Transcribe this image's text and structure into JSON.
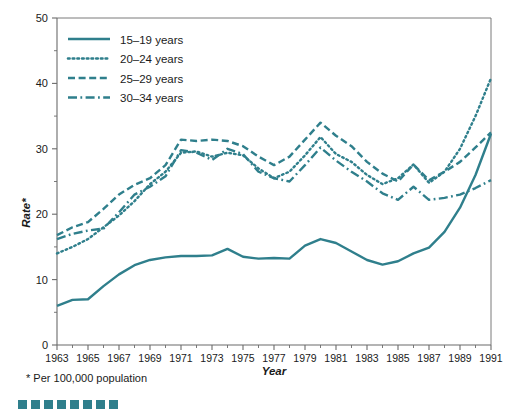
{
  "figure": {
    "footnote": "* Per 100,000 population",
    "accent_color": "#2f7f8c",
    "axis_color": "#6b6b6b",
    "text_color": "#1a1a1a",
    "decor_square_count": 8
  },
  "chart_data": {
    "type": "line",
    "title": "",
    "xlabel": "Year",
    "ylabel": "Rate*",
    "xlim": [
      1963,
      1991
    ],
    "ylim": [
      0,
      50
    ],
    "yticks": [
      0,
      10,
      20,
      30,
      40,
      50
    ],
    "xticks": [
      1963,
      1965,
      1967,
      1969,
      1971,
      1973,
      1975,
      1977,
      1979,
      1981,
      1983,
      1985,
      1987,
      1989,
      1991
    ],
    "xtick_labels": [
      "1963",
      "1965",
      "1967",
      "1969",
      "1971",
      "1973",
      "1975",
      "1977",
      "1979",
      "1981",
      "1983",
      "1985",
      "1987",
      "1989",
      "1991"
    ],
    "ytick_labels": [
      "0",
      "10",
      "20",
      "30",
      "40",
      "50"
    ],
    "grid": false,
    "legend_position": "upper-left-inside",
    "x": [
      1963,
      1964,
      1965,
      1966,
      1967,
      1968,
      1969,
      1970,
      1971,
      1972,
      1973,
      1974,
      1975,
      1976,
      1977,
      1978,
      1979,
      1980,
      1981,
      1982,
      1983,
      1984,
      1985,
      1986,
      1987,
      1988,
      1989,
      1990,
      1991
    ],
    "series": [
      {
        "name": "15–19 years",
        "label": "15–19 years",
        "dash": "solid",
        "color": "#2f7f8c",
        "values": [
          6.0,
          6.9,
          7.0,
          9.0,
          10.8,
          12.2,
          13.0,
          13.4,
          13.6,
          13.6,
          13.7,
          14.7,
          13.5,
          13.2,
          13.3,
          13.2,
          15.2,
          16.2,
          15.6,
          14.3,
          13.0,
          12.3,
          12.8,
          14.0,
          14.9,
          17.3,
          21.0,
          26.0,
          32.3
        ]
      },
      {
        "name": "20–24 years",
        "label": "20–24 years",
        "dash": "dotted",
        "color": "#2f7f8c",
        "values": [
          14.0,
          15.0,
          16.2,
          18.0,
          19.8,
          22.0,
          24.6,
          26.5,
          29.4,
          29.6,
          28.8,
          29.4,
          29.0,
          27.0,
          25.5,
          26.5,
          29.0,
          31.8,
          29.2,
          28.0,
          26.0,
          24.6,
          25.5,
          27.6,
          24.8,
          26.5,
          30.0,
          35.0,
          40.8
        ]
      },
      {
        "name": "25–29 years",
        "label": "25–29 years",
        "dash": "dashed",
        "color": "#2f7f8c",
        "values": [
          16.8,
          18.0,
          18.8,
          20.8,
          23.0,
          24.5,
          25.5,
          27.5,
          31.4,
          31.2,
          31.4,
          31.2,
          30.4,
          28.8,
          27.5,
          28.8,
          31.4,
          34.0,
          32.0,
          30.4,
          28.0,
          26.2,
          25.0,
          27.6,
          25.2,
          26.5,
          28.0,
          30.2,
          32.5
        ]
      },
      {
        "name": "30–34 years",
        "label": "30–34 years",
        "dash": "dashdot",
        "color": "#2f7f8c",
        "values": [
          16.2,
          17.0,
          17.5,
          17.8,
          20.3,
          23.0,
          24.2,
          25.8,
          29.8,
          29.4,
          28.3,
          30.0,
          29.2,
          26.5,
          25.5,
          25.0,
          27.5,
          30.2,
          28.2,
          26.5,
          25.0,
          23.2,
          22.2,
          24.2,
          22.2,
          22.5,
          23.0,
          24.0,
          25.2
        ]
      }
    ]
  },
  "legend": {
    "entries": [
      {
        "label": "15–19 years",
        "dash": "solid"
      },
      {
        "label": "20–24 years",
        "dash": "dotted"
      },
      {
        "label": "25–29 years",
        "dash": "dashed"
      },
      {
        "label": "30–34 years",
        "dash": "dashdot"
      }
    ]
  }
}
